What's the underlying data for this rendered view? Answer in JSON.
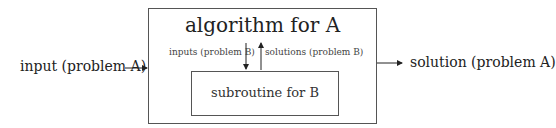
{
  "diagram": {
    "input_label": "input (problem A)",
    "output_label": "solution (problem A)",
    "outer_box": {
      "title": "algorithm for A"
    },
    "inner_box": {
      "label": "subroutine for B"
    },
    "down_arrow_label": "inputs (problem B)",
    "up_arrow_label": "solutions (problem B)"
  }
}
